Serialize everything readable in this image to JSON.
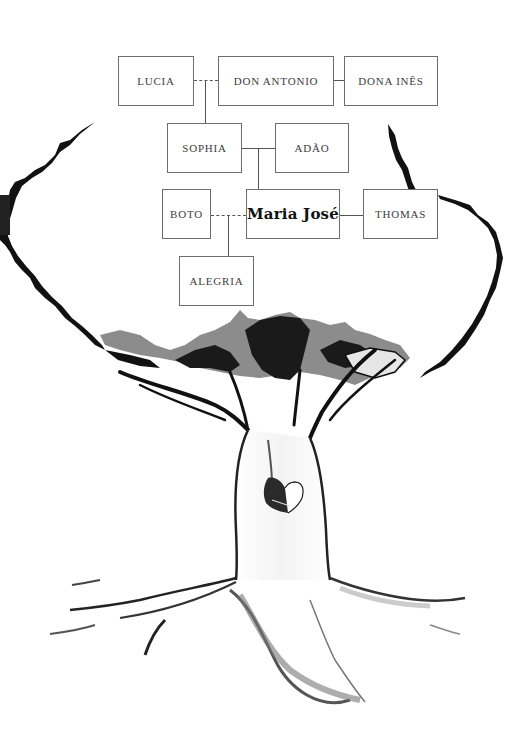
{
  "diagram": {
    "type": "family-tree",
    "focus_person": "Maria José",
    "people": [
      {
        "id": "lucia",
        "name": "LUCIA",
        "generation": 1
      },
      {
        "id": "don_antonio",
        "name": "DON ANTONIO",
        "generation": 1
      },
      {
        "id": "dona_ines",
        "name": "DONA INÊS",
        "generation": 1
      },
      {
        "id": "sophia",
        "name": "SOPHIA",
        "generation": 2
      },
      {
        "id": "adao",
        "name": "ADÃO",
        "generation": 2
      },
      {
        "id": "boto",
        "name": "BOTO",
        "generation": 3
      },
      {
        "id": "maria_jose",
        "name": "Maria José",
        "generation": 3
      },
      {
        "id": "thomas",
        "name": "THOMAS",
        "generation": 3
      },
      {
        "id": "alegria",
        "name": "ALEGRIA",
        "generation": 4
      }
    ],
    "relationships": [
      {
        "from": "lucia",
        "to": "don_antonio",
        "type": "affair",
        "style": "dashed"
      },
      {
        "from": "don_antonio",
        "to": "dona_ines",
        "type": "marriage",
        "style": "solid"
      },
      {
        "from": "lucia+don_antonio",
        "to": "sophia",
        "type": "child"
      },
      {
        "from": "sophia",
        "to": "adao",
        "type": "marriage",
        "style": "solid"
      },
      {
        "from": "sophia+adao",
        "to": "maria_jose",
        "type": "child"
      },
      {
        "from": "boto",
        "to": "maria_jose",
        "type": "affair",
        "style": "dashed"
      },
      {
        "from": "maria_jose",
        "to": "thomas",
        "type": "marriage",
        "style": "solid"
      },
      {
        "from": "boto+maria_jose",
        "to": "alegria",
        "type": "child"
      }
    ],
    "illustration": "ink-drawn tree with roots and a heart carved into the trunk",
    "colors": {
      "box_border": "#6e6e6e",
      "text": "#3c3c3c",
      "ink": "#111111",
      "foliage_gray": "#8c8c8c"
    }
  }
}
